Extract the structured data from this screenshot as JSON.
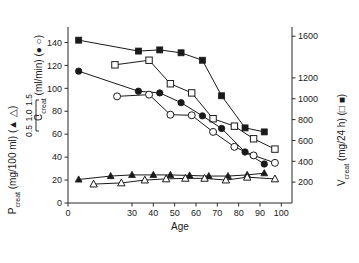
{
  "figure": {
    "xlabel": "Age",
    "left_axis_title": "C_creat (ml/min) ( ● ○ )",
    "left_axis_title_plain": "Ccreat (ml/min) (",
    "left_axis_title_sub": "creat",
    "left_axis_title_main": "C",
    "left_axis_title_unit": " (ml/min) (",
    "left_axis_title_syms": "● ○",
    "left_axis_title_close": ")",
    "left_axis2_main": "P",
    "left_axis2_sub": "creat",
    "left_axis2_unit": " (mg/100 ml) (",
    "left_axis2_syms": "▲ △",
    "left_axis2_close": ")",
    "right_axis_main": "V",
    "right_axis_sub": "creat",
    "right_axis_unit": " (mg/24 h) (",
    "right_axis_syms": "□ ■",
    "right_axis_close": ")",
    "mini_scale_ticks": [
      "1.5",
      "1.0",
      "0.5"
    ]
  },
  "chart_data": {
    "type": "line",
    "title": "",
    "xlabel": "Age",
    "ylabel": "Ccreat (ml/min)",
    "y2label": "Vcreat (mg/24 h)",
    "y3label": "Pcreat (mg/100 ml)",
    "xlim": [
      0,
      105
    ],
    "ylim": [
      0,
      150
    ],
    "y2lim": [
      0,
      1650
    ],
    "y3lim": [
      0,
      1.7
    ],
    "grid": false,
    "legend_position": "in-axis-titles",
    "xticks": [
      0,
      30,
      40,
      50,
      60,
      70,
      80,
      90,
      100
    ],
    "xticklabels": [
      "0",
      "30",
      "40",
      "50",
      "60",
      "70",
      "80",
      "90",
      "100"
    ],
    "yticks": [
      0,
      20,
      40,
      60,
      80,
      100,
      120,
      140
    ],
    "yticklabels": [
      "0",
      "20",
      "40",
      "60",
      "80",
      "100",
      "120",
      "140"
    ],
    "y2ticks": [
      200,
      400,
      600,
      800,
      1000,
      1200,
      1600
    ],
    "y2ticklabels": [
      "200",
      "400",
      "600",
      "800",
      "1000",
      "1200",
      "1600"
    ],
    "mini_yticks": [
      0.5,
      1.0,
      1.5
    ],
    "mini_yticklabels": [
      "0.5",
      "1.0",
      "1.5"
    ],
    "series": [
      {
        "name": "Vcreat male (filled square)",
        "marker": "filled-square",
        "axis": "right",
        "x": [
          5,
          33,
          43,
          53,
          63,
          72,
          83,
          92
        ],
        "values": [
          142,
          132.5,
          133.5,
          131,
          124.5,
          93.5,
          65.5,
          62
        ],
        "values_right_axis": [
          1565,
          1458,
          1470,
          1442,
          1370,
          1029,
          721,
          682
        ]
      },
      {
        "name": "Vcreat female (open square)",
        "marker": "open-square",
        "axis": "right",
        "x": [
          22,
          38,
          48,
          58,
          68,
          78,
          87,
          97
        ],
        "values": [
          120.5,
          124.5,
          104,
          96,
          73.5,
          67,
          56,
          47
        ],
        "values_right_axis": [
          1326,
          1370,
          1144,
          1056,
          809,
          737,
          616,
          517
        ]
      },
      {
        "name": "Ccreat male (filled circle)",
        "marker": "filled-circle",
        "axis": "left",
        "x": [
          5,
          33,
          43,
          53,
          63,
          72,
          83,
          92
        ],
        "values": [
          115,
          97.5,
          96,
          87.5,
          76,
          65,
          44.5,
          34
        ]
      },
      {
        "name": "Ccreat female (open circle)",
        "marker": "open-circle",
        "axis": "left",
        "x": [
          23,
          38,
          48,
          58,
          68,
          78,
          87,
          97
        ],
        "values": [
          93,
          94.5,
          77,
          76.5,
          62,
          49,
          41.5,
          35
        ]
      },
      {
        "name": "Pcreat male (filled triangle)",
        "marker": "filled-triangle",
        "axis": "left-secondary",
        "x": [
          5,
          20,
          30,
          40,
          48,
          57,
          66,
          75,
          84,
          92
        ],
        "values": [
          20.5,
          23.5,
          24.5,
          24.5,
          24.5,
          24,
          23.5,
          23.5,
          24.5,
          26
        ]
      },
      {
        "name": "Pcreat female (open triangle)",
        "marker": "open-triangle",
        "axis": "left-secondary",
        "x": [
          12,
          25,
          36,
          46,
          55,
          64,
          74,
          84,
          97
        ],
        "values": [
          16.5,
          17.5,
          20,
          21,
          21.5,
          21.5,
          20,
          22.5,
          21
        ]
      }
    ]
  }
}
